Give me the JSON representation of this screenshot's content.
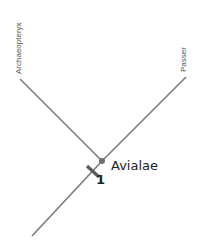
{
  "diagram": {
    "type": "cladogram",
    "taxa": [
      {
        "label": "Archaeopteryx",
        "tip": [
          20,
          79
        ]
      },
      {
        "label": "Passer",
        "tip": [
          186,
          77
        ]
      }
    ],
    "node": {
      "label": "Avialae",
      "position": [
        102,
        161
      ],
      "synapomorphy_number": "1"
    },
    "root": [
      32,
      236
    ],
    "colors": {
      "line": "#7a7a7a",
      "node": "#6e6e6e",
      "tick": "#5a5a5a",
      "text": "#222222"
    }
  }
}
